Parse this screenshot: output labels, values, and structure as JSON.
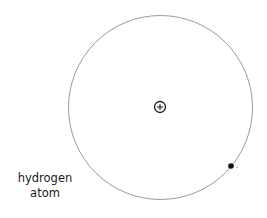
{
  "diagram": {
    "title_line1": "hydrogen",
    "title_line2": "atom",
    "orbit": {
      "cx": 160.5,
      "cy": 107.5,
      "r": 92,
      "stroke": "#9a9a9a"
    },
    "nucleus": {
      "cx": 160,
      "cy": 107,
      "r": 5.5,
      "symbol": "+",
      "stroke": "#1a1a1a"
    },
    "electron": {
      "cx": 231,
      "cy": 166,
      "r": 2.8,
      "charge": "-",
      "fill": "#111111"
    }
  }
}
